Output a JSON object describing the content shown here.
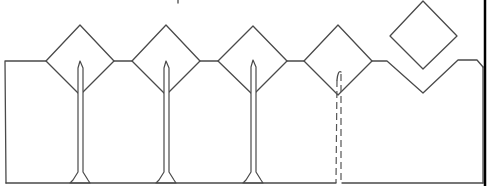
{
  "diagram": {
    "type": "line-drawing",
    "description": "Fence-like outline: rectangular base with four diamond shapes along the top edge, each with a vertical tapered post descending to the baseline; the fourth post is dashed; a fifth diamond floats detached above a V-shaped notch on the right.",
    "colors": {
      "line": "#4a4a4a",
      "border": "#000000",
      "background": "#ffffff"
    },
    "diamonds": [
      {
        "id": 1,
        "cx": 80,
        "cy": 60,
        "half_w": 34,
        "half_h": 35,
        "post": "solid"
      },
      {
        "id": 2,
        "cx": 166,
        "cy": 60,
        "half_w": 34,
        "half_h": 35,
        "post": "solid"
      },
      {
        "id": 3,
        "cx": 253,
        "cy": 60,
        "half_w": 34,
        "half_h": 35,
        "post": "solid"
      },
      {
        "id": 4,
        "cx": 338,
        "cy": 60,
        "half_w": 34,
        "half_h": 35,
        "post": "dashed"
      },
      {
        "id": 5,
        "cx": 423,
        "cy": 35,
        "half_w": 33,
        "half_h": 34,
        "post": "none",
        "detached": true
      }
    ],
    "notch": {
      "label": "V-notch where detached diamond belongs",
      "apex_x": 423,
      "apex_y": 93
    }
  }
}
